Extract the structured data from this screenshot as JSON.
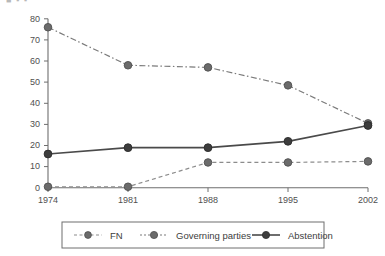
{
  "chart_data": {
    "type": "line",
    "title": "",
    "xlabel": "",
    "ylabel": "",
    "categories": [
      "1974",
      "1981",
      "1988",
      "1995",
      "2002"
    ],
    "x": [
      1974,
      1981,
      1988,
      1995,
      2002
    ],
    "ylim": [
      0,
      80
    ],
    "yticks": [
      0,
      10,
      20,
      30,
      40,
      50,
      60,
      70,
      80
    ],
    "ytick_labels": [
      "0",
      "10",
      "20",
      "30",
      "40",
      "50",
      "60",
      "70",
      "80"
    ],
    "grid": false,
    "legend_position": "bottom",
    "series": [
      {
        "name": "FN",
        "values": [
          0.5,
          0.5,
          12.0,
          12.0,
          12.5
        ],
        "line_style": "dashed",
        "color": "#8c8c8c",
        "marker": "circle"
      },
      {
        "name": "Governing parties",
        "values": [
          76.0,
          58.0,
          57.0,
          48.5,
          30.5
        ],
        "line_style": "dash-dot",
        "color": "#7a7a7a",
        "marker": "circle"
      },
      {
        "name": "Abstention",
        "values": [
          16.0,
          19.0,
          19.0,
          22.0,
          29.5
        ],
        "line_style": "solid",
        "color": "#4a4a4a",
        "marker": "circle"
      }
    ]
  },
  "axis": {
    "y_labels": [
      "80",
      "70",
      "60",
      "50",
      "40",
      "30",
      "20",
      "10",
      "0"
    ],
    "x_labels": [
      "1974",
      "1981",
      "1988",
      "1995",
      "2002"
    ]
  },
  "legend": {
    "items": [
      {
        "label": "FN"
      },
      {
        "label": "Governing parties"
      },
      {
        "label": "Abstention"
      }
    ]
  },
  "artifacts": {
    "clipped_header": "■ ▪ ▪"
  },
  "colors": {
    "axis": "#6e6e6e",
    "marker": "#6b6b6b",
    "abstention": "#4a4a4a",
    "governing": "#7a7a7a",
    "fn": "#8c8c8c",
    "legend_border": "#6e6e6e",
    "background": "#ffffff"
  }
}
